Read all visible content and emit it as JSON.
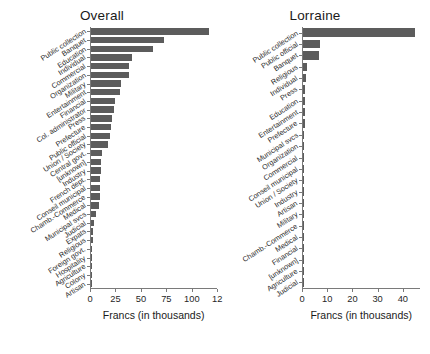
{
  "figure": {
    "width": 430,
    "height": 354,
    "bar_color": "#5c5c5c",
    "axis_color": "#7a7a7a",
    "text_color": "#1f1f1f"
  },
  "panels": [
    {
      "id": "overall",
      "title": "Overall",
      "xlabel": "Francs (in thousands)"
    },
    {
      "id": "lorraine",
      "title": "Lorraine",
      "xlabel": "Francs (in thousands)"
    }
  ],
  "chart_data": [
    {
      "type": "bar",
      "orientation": "horizontal",
      "title": "Overall",
      "xlabel": "Francs (in thousands)",
      "ylabel": "",
      "xlim": [
        0,
        125
      ],
      "xticks": [
        0,
        25,
        50,
        75,
        100,
        125
      ],
      "xtick_labels": [
        "0",
        "25",
        "50",
        "75",
        "100",
        "12"
      ],
      "grid": false,
      "legend": "none",
      "categories": [
        "Public collection",
        "Banquet",
        "Education",
        "Individual",
        "Commercial",
        "Organization",
        "Military",
        "Entertainment",
        "Financial",
        "Col. administrator",
        "Press",
        "Prefecture",
        "Public official",
        "Union / Society",
        "Central govt.",
        "[unknown]",
        "Industry",
        "French dept.",
        "Conseil municipal",
        "Chamb.-Commerce",
        "Medical",
        "Municipal svcs",
        "Judicial",
        "Expats",
        "Religious",
        "Foreign govt.",
        "Hospitality",
        "Agriculture",
        "Colony",
        "Artisan"
      ],
      "values": [
        116,
        72,
        61,
        40,
        37,
        37,
        29,
        28,
        24,
        23,
        21,
        20,
        19,
        17,
        11,
        10,
        10,
        9,
        9,
        9,
        8,
        5,
        3,
        2,
        1.5,
        1.2,
        1,
        0.8,
        0.5,
        0.3
      ]
    },
    {
      "type": "bar",
      "orientation": "horizontal",
      "title": "Lorraine",
      "xlabel": "Francs (in thousands)",
      "ylabel": "",
      "xlim": [
        0,
        47
      ],
      "xticks": [
        0,
        10,
        20,
        30,
        40
      ],
      "xtick_labels": [
        "0",
        "10",
        "20",
        "30",
        "40"
      ],
      "grid": false,
      "legend": "none",
      "categories": [
        "Public collection",
        "Public official",
        "Banquet",
        "Religious",
        "Individual",
        "Press",
        "Education",
        "Entertainment",
        "Prefecture",
        "Municipal svcs",
        "Organization",
        "Commercial",
        "Conseil municipal",
        "Union / Society",
        "Industry",
        "Artisan",
        "Military",
        "Chamb.-Commerce",
        "Medical",
        "Financial",
        "[unknown]",
        "Agriculture",
        "Judicial"
      ],
      "values": [
        44.5,
        6.6,
        6.2,
        1.6,
        1.0,
        0.9,
        0.8,
        0.7,
        0.6,
        0.55,
        0.5,
        0.45,
        0.4,
        0.35,
        0.3,
        0.28,
        0.25,
        0.22,
        0.2,
        0.18,
        0.15,
        0.12,
        0.1
      ]
    }
  ]
}
